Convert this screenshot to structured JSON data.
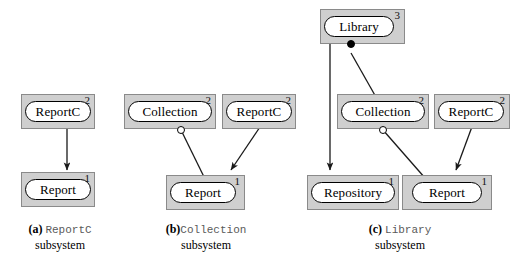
{
  "figure": {
    "background_color": "#ffffff",
    "box_fill": "#cfcfcf",
    "box_border": "#8a8a8a",
    "oval_fill": "#ffffff",
    "oval_border": "#000000",
    "line_color": "#1a1a1a"
  },
  "subsystems": [
    {
      "id": "a",
      "tag": "(a)",
      "name": "ReportC",
      "suffix": "subsystem",
      "nodes": [
        {
          "label": "ReportC",
          "level": "2"
        },
        {
          "label": "Report",
          "level": "1"
        }
      ],
      "edges": [
        {
          "from": "ReportC",
          "to": "Report",
          "endpoint": "arrow",
          "origin": "none"
        }
      ]
    },
    {
      "id": "b",
      "tag": "(b)",
      "name": "Collection",
      "suffix": "subsystem",
      "nodes": [
        {
          "label": "Collection",
          "level": "2"
        },
        {
          "label": "ReportC",
          "level": "2"
        },
        {
          "label": "Report",
          "level": "1"
        }
      ],
      "edges": [
        {
          "from": "Collection",
          "to": "Report",
          "endpoint": "plain",
          "origin": "hollow-circle"
        },
        {
          "from": "ReportC",
          "to": "Report",
          "endpoint": "arrow",
          "origin": "none"
        }
      ]
    },
    {
      "id": "c",
      "tag": "(c)",
      "name": "Library",
      "suffix": "subsystem",
      "nodes": [
        {
          "label": "Library",
          "level": "3"
        },
        {
          "label": "Collection",
          "level": "2"
        },
        {
          "label": "ReportC",
          "level": "2"
        },
        {
          "label": "Repository",
          "level": "1"
        },
        {
          "label": "Report",
          "level": "1"
        }
      ],
      "edges": [
        {
          "from": "Library",
          "to": "Repository",
          "endpoint": "arrow",
          "origin": "none"
        },
        {
          "from": "Library",
          "to": "Collection",
          "endpoint": "plain",
          "origin": "filled-dot"
        },
        {
          "from": "Collection",
          "to": "Report",
          "endpoint": "plain",
          "origin": "hollow-circle"
        },
        {
          "from": "ReportC",
          "to": "Report",
          "endpoint": "arrow",
          "origin": "none"
        }
      ]
    }
  ]
}
